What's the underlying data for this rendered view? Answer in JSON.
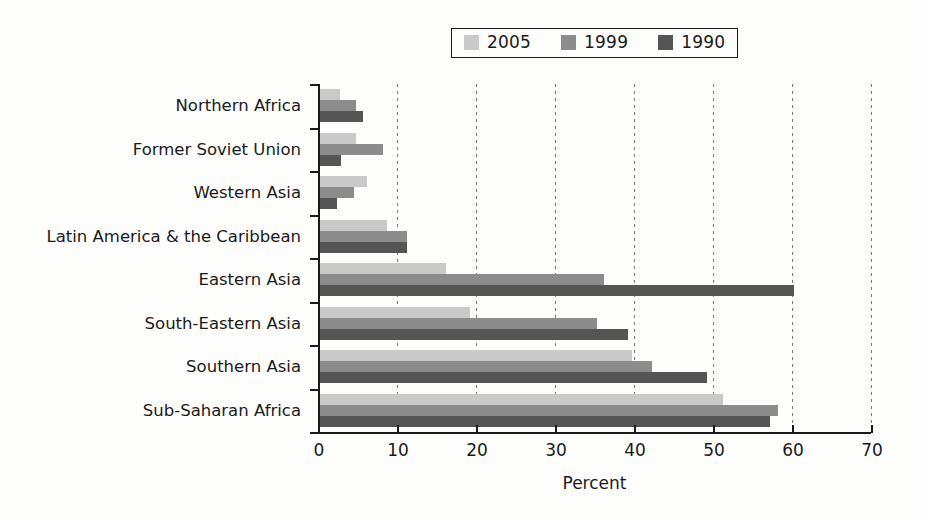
{
  "chart_data": {
    "type": "bar",
    "orientation": "horizontal",
    "title": "",
    "xlabel": "Percent",
    "ylabel": "",
    "xlim": [
      0,
      70
    ],
    "xticks": [
      0,
      10,
      20,
      30,
      40,
      50,
      60,
      70
    ],
    "grid": "vertical-dotted",
    "legend_position": "top-center",
    "categories": [
      "Northern Africa",
      "Former Soviet Union",
      "Western Asia",
      "Latin America & the Caribbean",
      "Eastern Asia",
      "South-Eastern Asia",
      "Southern Asia",
      "Sub-Saharan Africa"
    ],
    "series": [
      {
        "name": "2005",
        "color": "#c9c9c9",
        "values": [
          2.5,
          4.5,
          6.0,
          8.5,
          16.0,
          19.0,
          39.5,
          51.0
        ]
      },
      {
        "name": "1999",
        "color": "#8c8c8c",
        "values": [
          4.5,
          8.0,
          4.3,
          11.0,
          36.0,
          35.0,
          42.0,
          58.0
        ]
      },
      {
        "name": "1990",
        "color": "#555555",
        "values": [
          5.5,
          2.7,
          2.2,
          11.0,
          60.0,
          39.0,
          49.0,
          57.0
        ]
      }
    ]
  },
  "legend": {
    "entries": [
      {
        "label": "2005"
      },
      {
        "label": "1999"
      },
      {
        "label": "1990"
      }
    ]
  },
  "axis": {
    "x_title": "Percent",
    "x_tick_labels": [
      "0",
      "10",
      "20",
      "30",
      "40",
      "50",
      "60",
      "70"
    ]
  }
}
